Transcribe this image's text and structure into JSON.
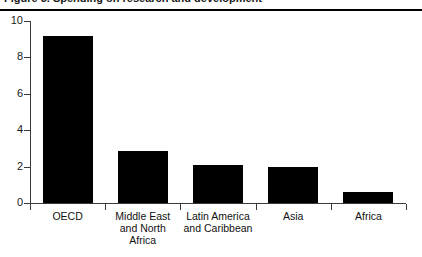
{
  "figure": {
    "caption_partial": "Figure 3. Spending on research and development",
    "background_color": "#ffffff",
    "bar_color": "#000000",
    "axis_color": "#3a3a3a"
  },
  "chart_data": {
    "type": "bar",
    "title": "",
    "xlabel": "",
    "ylabel": "",
    "categories": [
      "OECD",
      "Middle East and North Africa",
      "Latin America and Caribbean",
      "Asia",
      "Africa"
    ],
    "category_lines": [
      [
        "OECD"
      ],
      [
        "Middle East",
        "and North",
        "Africa"
      ],
      [
        "Latin America",
        "and Caribbean"
      ],
      [
        "Asia"
      ],
      [
        "Africa"
      ]
    ],
    "values": [
      9.2,
      2.85,
      2.1,
      2.0,
      0.6
    ],
    "ylim": [
      0,
      10
    ],
    "yticks": [
      0,
      2,
      4,
      6,
      8,
      10
    ],
    "ytick_labels": [
      "0",
      "2",
      "4",
      "6",
      "8",
      "10"
    ],
    "grid": false,
    "legend": false
  }
}
